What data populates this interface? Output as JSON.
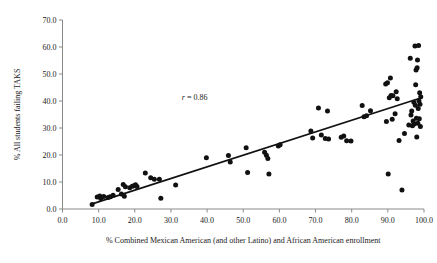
{
  "chart_data": {
    "type": "scatter",
    "title": "",
    "xlabel": "% Combined Mexican American (and other Latino) and African American enrollment",
    "ylabel": "% All students failing TAKS",
    "xlim": [
      0.0,
      100.0
    ],
    "ylim": [
      0.0,
      70.0
    ],
    "grid": false,
    "legend": null,
    "xticks": [
      "0.0",
      "10.0",
      "20.0",
      "30.0",
      "40.0",
      "50.0",
      "60.0",
      "70.0",
      "80.0",
      "90.0",
      "100.0"
    ],
    "xtick_values": [
      0,
      10,
      20,
      30,
      40,
      50,
      60,
      70,
      80,
      90,
      100
    ],
    "yticks": [
      "0.0",
      "10.0",
      "20.0",
      "30.0",
      "40.0",
      "50.0",
      "60.0",
      "70.0"
    ],
    "ytick_values": [
      0,
      10,
      20,
      30,
      40,
      50,
      60,
      70
    ],
    "annotations": [
      {
        "name": "correlation",
        "symbol": "r",
        "equals": " = ",
        "value": "0.86",
        "x": 33.0,
        "y": 40.5
      }
    ],
    "trendline": {
      "name": "linear-fit",
      "x0": 8.0,
      "y0": 1.8,
      "x1": 99.3,
      "y1": 41.2
    },
    "marker": {
      "shape": "circle",
      "color": "#111111",
      "size": 2.5
    },
    "points": [
      [
        8.2,
        1.7
      ],
      [
        9.6,
        4.4
      ],
      [
        10.3,
        4.8
      ],
      [
        10.6,
        3.9
      ],
      [
        11.4,
        4.6
      ],
      [
        12.6,
        4.3
      ],
      [
        13.2,
        4.5
      ],
      [
        14.0,
        5.1
      ],
      [
        15.4,
        7.2
      ],
      [
        16.3,
        5.6
      ],
      [
        16.8,
        9.1
      ],
      [
        17.1,
        4.7
      ],
      [
        17.4,
        8.2
      ],
      [
        18.6,
        7.9
      ],
      [
        19.3,
        8.4
      ],
      [
        19.8,
        8.6
      ],
      [
        20.2,
        9.0
      ],
      [
        20.6,
        8.3
      ],
      [
        22.9,
        13.3
      ],
      [
        24.4,
        11.6
      ],
      [
        25.4,
        11.0
      ],
      [
        26.8,
        11.0
      ],
      [
        27.2,
        4.0
      ],
      [
        31.3,
        8.9
      ],
      [
        39.8,
        19.0
      ],
      [
        45.9,
        19.8
      ],
      [
        46.4,
        17.4
      ],
      [
        50.8,
        22.7
      ],
      [
        51.2,
        13.5
      ],
      [
        55.9,
        21.0
      ],
      [
        56.4,
        19.9
      ],
      [
        56.8,
        18.7
      ],
      [
        57.1,
        13.0
      ],
      [
        59.7,
        23.3
      ],
      [
        60.2,
        23.8
      ],
      [
        68.7,
        28.9
      ],
      [
        69.2,
        26.3
      ],
      [
        70.8,
        37.4
      ],
      [
        71.6,
        27.4
      ],
      [
        72.7,
        26.1
      ],
      [
        73.3,
        36.3
      ],
      [
        73.6,
        25.9
      ],
      [
        77.1,
        26.6
      ],
      [
        77.8,
        27.0
      ],
      [
        78.6,
        25.3
      ],
      [
        79.8,
        25.2
      ],
      [
        82.9,
        38.3
      ],
      [
        83.4,
        34.2
      ],
      [
        84.1,
        34.5
      ],
      [
        85.2,
        36.4
      ],
      [
        89.4,
        46.3
      ],
      [
        89.6,
        32.4
      ],
      [
        89.9,
        46.8
      ],
      [
        90.1,
        13.0
      ],
      [
        90.4,
        41.2
      ],
      [
        90.7,
        48.5
      ],
      [
        90.9,
        42.0
      ],
      [
        91.2,
        33.2
      ],
      [
        91.4,
        41.9
      ],
      [
        92.0,
        35.3
      ],
      [
        92.3,
        43.4
      ],
      [
        92.6,
        40.8
      ],
      [
        93.1,
        25.4
      ],
      [
        93.9,
        7.0
      ],
      [
        94.6,
        28.0
      ],
      [
        95.8,
        31.1
      ],
      [
        96.2,
        55.8
      ],
      [
        96.4,
        34.8
      ],
      [
        96.6,
        36.3
      ],
      [
        96.8,
        30.8
      ],
      [
        97.0,
        32.6
      ],
      [
        97.2,
        39.5
      ],
      [
        97.3,
        31.5
      ],
      [
        97.5,
        60.4
      ],
      [
        97.6,
        38.4
      ],
      [
        97.7,
        46.0
      ],
      [
        97.8,
        51.5
      ],
      [
        97.9,
        33.6
      ],
      [
        98.0,
        26.7
      ],
      [
        98.1,
        52.3
      ],
      [
        98.2,
        55.2
      ],
      [
        98.3,
        31.8
      ],
      [
        98.4,
        37.2
      ],
      [
        98.5,
        60.6
      ],
      [
        98.6,
        40.1
      ],
      [
        98.7,
        33.4
      ],
      [
        98.8,
        43.1
      ],
      [
        98.9,
        38.8
      ],
      [
        99.0,
        30.6
      ],
      [
        99.1,
        41.6
      ]
    ]
  }
}
